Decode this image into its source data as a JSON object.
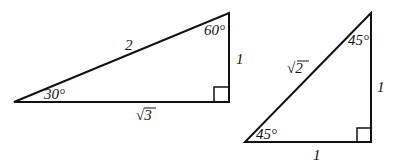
{
  "diagram": {
    "triangles": [
      {
        "name": "30-60-90 triangle",
        "angles": {
          "bottom_left": "30°",
          "top": "60°",
          "right": "90°"
        },
        "sides": {
          "hypotenuse": "2",
          "vertical_leg": "1",
          "horizontal_leg": "√3"
        }
      },
      {
        "name": "45-45-90 triangle",
        "angles": {
          "bottom_left": "45°",
          "top": "45°",
          "right": "90°"
        },
        "sides": {
          "hypotenuse": "√2",
          "vertical_leg": "1",
          "horizontal_leg": "1"
        }
      }
    ]
  }
}
